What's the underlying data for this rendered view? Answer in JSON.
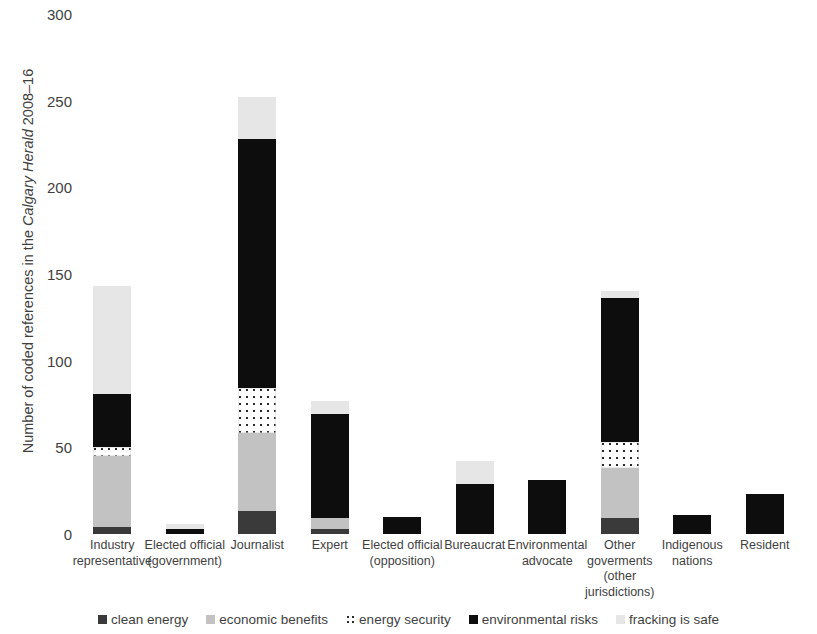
{
  "chart_data": {
    "type": "bar",
    "stacked": true,
    "title": "",
    "xlabel": "",
    "ylabel": "Number of coded references in the Calgary Herald 2008–16",
    "ylabel_italic_part": "Calgary Herald",
    "ylim": [
      0,
      300
    ],
    "yticks": [
      0,
      50,
      100,
      150,
      200,
      250,
      300
    ],
    "grid": false,
    "legend_position": "bottom",
    "categories": [
      "Industry representative",
      "Elected official (government)",
      "Journalist",
      "Expert",
      "Elected official (opposition)",
      "Bureaucrat",
      "Environmental advocate",
      "Other goverments (other jurisdictions)",
      "Indigenous nations",
      "Resident"
    ],
    "category_lines": [
      [
        "Industry",
        "representative"
      ],
      [
        "Elected official",
        "(government)"
      ],
      [
        "Journalist"
      ],
      [
        "Expert"
      ],
      [
        "Elected official",
        "(opposition)"
      ],
      [
        "Bureaucrat"
      ],
      [
        "Environmental",
        "advocate"
      ],
      [
        "Other",
        "goverments",
        "(other",
        "jurisdictions)"
      ],
      [
        "Indigenous",
        "nations"
      ],
      [
        "Resident"
      ]
    ],
    "series": [
      {
        "name": "clean energy",
        "key": "clean-energy",
        "color": "#3a3a3a",
        "values": [
          4,
          0,
          13,
          3,
          0,
          0,
          0,
          9,
          0,
          0
        ]
      },
      {
        "name": "economic benefits",
        "key": "economic-benefits",
        "color": "#c2c2c2",
        "values": [
          41,
          0,
          45,
          6,
          0,
          0,
          0,
          29,
          0,
          0
        ]
      },
      {
        "name": "energy security",
        "key": "energy-security",
        "color": "#ffffff",
        "values": [
          5,
          0,
          26,
          0,
          0,
          0,
          0,
          15,
          0,
          0
        ]
      },
      {
        "name": "environmental risks",
        "key": "environmental-risks",
        "color": "#0d0d0d",
        "values": [
          31,
          3,
          144,
          60,
          10,
          29,
          31,
          83,
          11,
          23
        ]
      },
      {
        "name": "fracking is safe",
        "key": "fracking-is-safe",
        "color": "#e6e6e6",
        "values": [
          62,
          3,
          24,
          8,
          0,
          13,
          0,
          4,
          0,
          0
        ]
      }
    ],
    "totals": [
      143,
      6,
      252,
      77,
      10,
      42,
      31,
      140,
      11,
      23
    ]
  }
}
